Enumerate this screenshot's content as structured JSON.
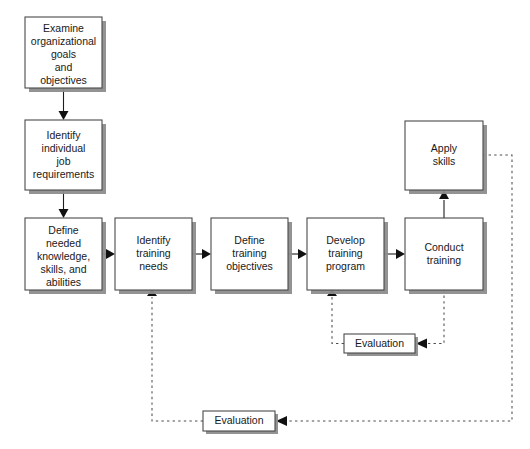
{
  "diagram": {
    "canvas": {
      "width": 530,
      "height": 449,
      "background": "#ffffff"
    },
    "colors": {
      "box_fill": "#ffffff",
      "box_border": "#4a4a4a",
      "box_shadow": "#8d8d8d",
      "solid_connector": "#1d1d1d",
      "dashed_connector": "#4d4d4d",
      "text": "#18191b"
    },
    "nodes": [
      {
        "id": "examine-goals",
        "lines": [
          "Examine",
          "organizational",
          "goals",
          "and",
          "objectives"
        ],
        "x": 25,
        "y": 17,
        "w": 77,
        "h": 71
      },
      {
        "id": "identify-job-requirements",
        "lines": [
          "Identify",
          "individual",
          "job",
          "requirements"
        ],
        "x": 25,
        "y": 120,
        "w": 77,
        "h": 70
      },
      {
        "id": "define-knowledge",
        "lines": [
          "Define",
          "needed",
          "knowledge,",
          "skills, and",
          "abilities"
        ],
        "x": 25,
        "y": 218,
        "w": 77,
        "h": 72
      },
      {
        "id": "identify-training-needs",
        "lines": [
          "Identify",
          "training",
          "needs"
        ],
        "x": 115,
        "y": 218,
        "w": 77,
        "h": 72
      },
      {
        "id": "define-training-objectives",
        "lines": [
          "Define",
          "training",
          "objectives"
        ],
        "x": 211,
        "y": 218,
        "w": 77,
        "h": 72
      },
      {
        "id": "develop-training-program",
        "lines": [
          "Develop",
          "training",
          "program"
        ],
        "x": 307,
        "y": 218,
        "w": 77,
        "h": 72
      },
      {
        "id": "conduct-training",
        "lines": [
          "Conduct",
          "training"
        ],
        "x": 405,
        "y": 218,
        "w": 78,
        "h": 72
      },
      {
        "id": "apply-skills",
        "lines": [
          "Apply",
          "skills"
        ],
        "x": 405,
        "y": 121,
        "w": 78,
        "h": 69
      }
    ],
    "feedback_nodes": [
      {
        "id": "evaluation-upper",
        "label": "Evaluation",
        "x": 344,
        "y": 334,
        "w": 71,
        "h": 19
      },
      {
        "id": "evaluation-lower",
        "label": "Evaluation",
        "x": 203,
        "y": 411,
        "w": 72,
        "h": 20
      }
    ],
    "connectors": [
      {
        "id": "examine-to-identify-job",
        "style": "solid",
        "from": "examine-goals",
        "to": "identify-job-requirements"
      },
      {
        "id": "identify-job-to-define-knowledge",
        "style": "solid",
        "from": "identify-job-requirements",
        "to": "define-knowledge"
      },
      {
        "id": "define-knowledge-to-training-needs",
        "style": "solid",
        "from": "define-knowledge",
        "to": "identify-training-needs"
      },
      {
        "id": "training-needs-to-objectives",
        "style": "solid",
        "from": "identify-training-needs",
        "to": "define-training-objectives"
      },
      {
        "id": "objectives-to-develop-program",
        "style": "solid",
        "from": "define-training-objectives",
        "to": "develop-training-program"
      },
      {
        "id": "develop-program-to-conduct",
        "style": "solid",
        "from": "develop-training-program",
        "to": "conduct-training"
      },
      {
        "id": "conduct-to-apply-skills",
        "style": "solid",
        "from": "conduct-training",
        "to": "apply-skills"
      },
      {
        "id": "conduct-training-to-evaluation-upper",
        "style": "dashed",
        "from": "conduct-training",
        "to": "evaluation-upper"
      },
      {
        "id": "evaluation-upper-to-develop-program",
        "style": "dashed",
        "from": "evaluation-upper",
        "to": "develop-training-program"
      },
      {
        "id": "apply-skills-to-evaluation-lower",
        "style": "dashed",
        "from": "apply-skills",
        "to": "evaluation-lower"
      },
      {
        "id": "evaluation-lower-to-training-needs",
        "style": "dashed",
        "from": "evaluation-lower",
        "to": "identify-training-needs"
      }
    ]
  }
}
